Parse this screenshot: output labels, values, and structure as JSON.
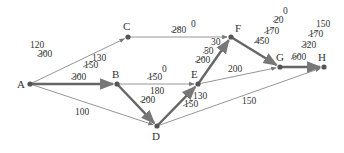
{
  "diagram": {
    "type": "network-flow-graph",
    "colors": {
      "thin_edge": "#8a8a8a",
      "thick_edge": "#666666",
      "node": "#555555",
      "text": "#333333"
    },
    "nodes": [
      {
        "id": "A",
        "label": "A",
        "x": 30,
        "y": 84,
        "lx": 17,
        "ly": 88
      },
      {
        "id": "B",
        "label": "B",
        "x": 117,
        "y": 84,
        "lx": 112,
        "ly": 78
      },
      {
        "id": "C",
        "label": "C",
        "x": 128,
        "y": 37,
        "lx": 123,
        "ly": 30
      },
      {
        "id": "D",
        "label": "D",
        "x": 157,
        "y": 126,
        "lx": 152,
        "ly": 140
      },
      {
        "id": "E",
        "label": "E",
        "x": 198,
        "y": 84,
        "lx": 191,
        "ly": 78
      },
      {
        "id": "F",
        "label": "F",
        "x": 231,
        "y": 37,
        "lx": 235,
        "ly": 32
      },
      {
        "id": "G",
        "label": "G",
        "x": 280,
        "y": 67,
        "lx": 276,
        "ly": 61
      },
      {
        "id": "H",
        "label": "H",
        "x": 324,
        "y": 67,
        "lx": 318,
        "ly": 61
      }
    ],
    "edges": [
      {
        "from": "A",
        "to": "C",
        "thick": false,
        "labels": [
          {
            "text": "120",
            "x": 30,
            "y": 48,
            "struck": false
          },
          {
            "text": "300",
            "x": 38,
            "y": 57,
            "struck": true
          },
          {
            "text": "130",
            "x": 92,
            "y": 61,
            "struck": false
          },
          {
            "text": "150",
            "x": 84,
            "y": 68,
            "struck": true
          }
        ]
      },
      {
        "from": "A",
        "to": "B",
        "thick": true,
        "labels": [
          {
            "text": "300",
            "x": 72,
            "y": 80,
            "struck": true
          }
        ]
      },
      {
        "from": "A",
        "to": "D",
        "thick": false,
        "labels": [
          {
            "text": "100",
            "x": 75,
            "y": 115,
            "struck": false
          }
        ]
      },
      {
        "from": "C",
        "to": "F",
        "thick": false,
        "labels": [
          {
            "text": "280",
            "x": 172,
            "y": 33,
            "struck": true
          },
          {
            "text": "0",
            "x": 191,
            "y": 27,
            "struck": false
          }
        ]
      },
      {
        "from": "B",
        "to": "E",
        "thick": false,
        "labels": [
          {
            "text": "0",
            "x": 162,
            "y": 72,
            "struck": false
          },
          {
            "text": "150",
            "x": 148,
            "y": 80,
            "struck": true
          },
          {
            "text": "180",
            "x": 150,
            "y": 94,
            "struck": false
          }
        ]
      },
      {
        "from": "B",
        "to": "D",
        "thick": true,
        "labels": [
          {
            "text": "200",
            "x": 141,
            "y": 103,
            "struck": true
          }
        ]
      },
      {
        "from": "D",
        "to": "E",
        "thick": true,
        "labels": [
          {
            "text": "130",
            "x": 193,
            "y": 99,
            "struck": false
          },
          {
            "text": "150",
            "x": 184,
            "y": 107,
            "struck": true
          }
        ]
      },
      {
        "from": "D",
        "to": "H",
        "thick": false,
        "labels": [
          {
            "text": "150",
            "x": 242,
            "y": 104,
            "struck": false
          }
        ]
      },
      {
        "from": "E",
        "to": "F",
        "thick": true,
        "labels": [
          {
            "text": "30",
            "x": 211,
            "y": 45,
            "struck": false
          },
          {
            "text": "50",
            "x": 204,
            "y": 54,
            "struck": true
          },
          {
            "text": "200",
            "x": 196,
            "y": 63,
            "struck": true
          }
        ]
      },
      {
        "from": "E",
        "to": "G",
        "thick": false,
        "labels": [
          {
            "text": "200",
            "x": 228,
            "y": 72,
            "struck": false
          }
        ]
      },
      {
        "from": "F",
        "to": "G",
        "thick": true,
        "labels": [
          {
            "text": "0",
            "x": 283,
            "y": 14,
            "struck": false
          },
          {
            "text": "20",
            "x": 274,
            "y": 23,
            "struck": true
          },
          {
            "text": "170",
            "x": 265,
            "y": 34,
            "struck": true
          },
          {
            "text": "450",
            "x": 255,
            "y": 44,
            "struck": true
          }
        ]
      },
      {
        "from": "G",
        "to": "H",
        "thick": true,
        "labels": [
          {
            "text": "150",
            "x": 316,
            "y": 27,
            "struck": false
          },
          {
            "text": "170",
            "x": 309,
            "y": 37,
            "struck": true
          },
          {
            "text": "320",
            "x": 302,
            "y": 48,
            "struck": true
          },
          {
            "text": "600",
            "x": 292,
            "y": 60,
            "struck": true
          }
        ]
      }
    ]
  }
}
